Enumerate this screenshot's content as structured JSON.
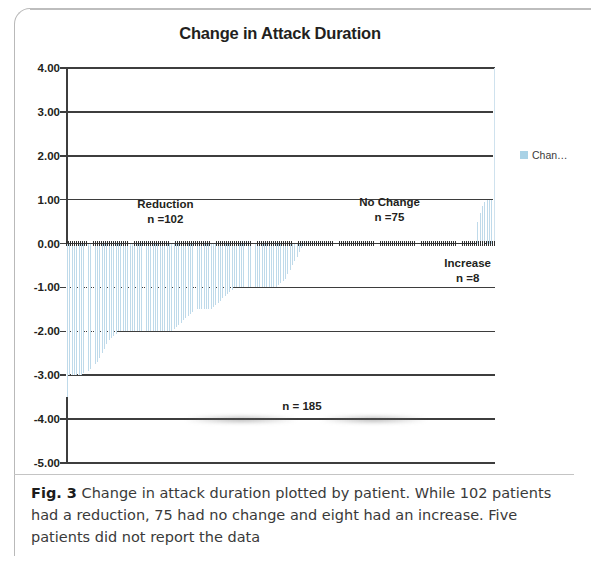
{
  "figure": {
    "caption_label": "Fig. 3",
    "caption_text": " Change in attack duration plotted by patient. While 102 patients had a reduction, 75 had no change and eight had an increase. Five patients did not report the data"
  },
  "legend": {
    "label": "Chan…",
    "swatch_color": "#a9d2e6",
    "position": "right"
  },
  "annotations": {
    "reduction_title": "Reduction",
    "reduction_n": "n =102",
    "nochange_title": "No Change",
    "nochange_n": "n =75",
    "increase_title": "Increase",
    "increase_n": "n =8",
    "total_n": "n = 185"
  },
  "chart_data": {
    "type": "bar",
    "title": "Change in Attack Duration",
    "xlabel": "",
    "ylabel": "",
    "ylim": [
      -5.0,
      4.0
    ],
    "ytick_labels": [
      "4.00",
      "3.00",
      "2.00",
      "1.00",
      "0.00",
      "-1.00",
      "-2.00",
      "-3.00",
      "-4.00",
      "-5.00"
    ],
    "ytick_values": [
      4,
      3,
      2,
      1,
      0,
      -1,
      -2,
      -3,
      -4,
      -5
    ],
    "grid": true,
    "xaxis_visible": false,
    "series_name": "Change in Attack Duration",
    "bar_color": "#bfdaea",
    "n_patients_plotted": 185,
    "groups": [
      {
        "name": "Reduction",
        "count": 102,
        "sign": "negative"
      },
      {
        "name": "No Change",
        "count": 75,
        "sign": "zero"
      },
      {
        "name": "Increase",
        "count": 8,
        "sign": "positive"
      }
    ],
    "values": [
      -3.5,
      -3.0,
      -3.0,
      -3.0,
      -3.0,
      -3.0,
      -3.0,
      -2.95,
      -2.9,
      -2.9,
      -2.85,
      -2.8,
      -2.75,
      -2.7,
      -2.6,
      -2.5,
      -2.4,
      -2.3,
      -2.2,
      -2.15,
      -2.1,
      -2.05,
      -2.0,
      -2.0,
      -2.0,
      -2.0,
      -2.0,
      -2.0,
      -2.0,
      -2.0,
      -2.0,
      -2.0,
      -2.0,
      -2.0,
      -2.0,
      -2.0,
      -2.0,
      -2.0,
      -2.0,
      -2.0,
      -2.0,
      -2.0,
      -2.0,
      -2.0,
      -2.0,
      -2.0,
      -1.95,
      -1.9,
      -1.85,
      -1.8,
      -1.75,
      -1.7,
      -1.65,
      -1.6,
      -1.55,
      -1.5,
      -1.5,
      -1.5,
      -1.5,
      -1.5,
      -1.5,
      -1.5,
      -1.5,
      -1.45,
      -1.4,
      -1.35,
      -1.3,
      -1.25,
      -1.2,
      -1.15,
      -1.1,
      -1.05,
      -1.0,
      -1.0,
      -1.0,
      -1.0,
      -1.0,
      -1.0,
      -1.0,
      -1.0,
      -1.0,
      -1.0,
      -1.0,
      -1.0,
      -1.0,
      -1.0,
      -1.0,
      -1.0,
      -1.0,
      -1.0,
      -1.0,
      -0.95,
      -0.9,
      -0.85,
      -0.8,
      -0.7,
      -0.6,
      -0.5,
      -0.4,
      -0.3,
      -0.2,
      -0.1,
      0,
      0,
      0,
      0,
      0,
      0,
      0,
      0,
      0,
      0,
      0,
      0,
      0,
      0,
      0,
      0,
      0,
      0,
      0,
      0,
      0,
      0,
      0,
      0,
      0,
      0,
      0,
      0,
      0,
      0,
      0,
      0,
      0,
      0,
      0,
      0,
      0,
      0,
      0,
      0,
      0,
      0,
      0,
      0,
      0,
      0,
      0,
      0,
      0,
      0,
      0,
      0,
      0,
      0,
      0,
      0,
      0,
      0,
      0,
      0,
      0,
      0,
      0,
      0,
      0,
      0,
      0,
      0,
      0,
      0,
      0,
      0,
      0,
      0,
      0,
      0.5,
      0.7,
      0.85,
      0.95,
      1.0,
      1.0,
      1.0,
      3.9
    ]
  }
}
